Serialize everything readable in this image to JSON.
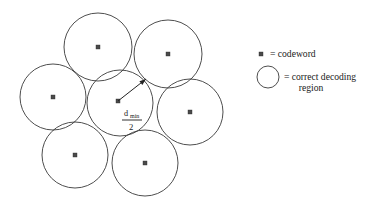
{
  "figure": {
    "name": "sphere-packing-decoding-regions",
    "background_color": "#ffffff",
    "stroke_color": "#3a3a3a",
    "marker_color": "#4a4a4a",
    "text_color": "#1a1a1a"
  },
  "circles": [
    {
      "id": "circle-top-left",
      "cx": 98,
      "cy": 47,
      "r": 34
    },
    {
      "id": "circle-top-right",
      "cx": 168,
      "cy": 54,
      "r": 34
    },
    {
      "id": "circle-middle-left",
      "cx": 53,
      "cy": 97,
      "r": 33
    },
    {
      "id": "circle-center",
      "cx": 120,
      "cy": 103,
      "r": 33
    },
    {
      "id": "circle-middle-right",
      "cx": 190,
      "cy": 112,
      "r": 33
    },
    {
      "id": "circle-bottom-left",
      "cx": 75,
      "cy": 155,
      "r": 33
    },
    {
      "id": "circle-bottom-right",
      "cx": 145,
      "cy": 163,
      "r": 33
    }
  ],
  "codewords": [
    {
      "id": "codeword-top-left",
      "x": 98,
      "y": 47,
      "size": 4
    },
    {
      "id": "codeword-top-right",
      "x": 168,
      "y": 54,
      "size": 4
    },
    {
      "id": "codeword-middle-left",
      "x": 53,
      "y": 97,
      "size": 4
    },
    {
      "id": "codeword-center",
      "x": 118,
      "y": 101,
      "size": 4
    },
    {
      "id": "codeword-middle-right",
      "x": 190,
      "y": 112,
      "size": 4
    },
    {
      "id": "codeword-bottom-left",
      "x": 75,
      "y": 155,
      "size": 4
    },
    {
      "id": "codeword-bottom-right",
      "x": 145,
      "y": 163,
      "size": 4
    }
  ],
  "radius_annotation": {
    "label_numerator": "d",
    "label_subscript": "min",
    "label_denominator": "2",
    "arrow_start_x": 118,
    "arrow_start_y": 101,
    "arrow_end_x": 146,
    "arrow_end_y": 79,
    "numerator_x": 124,
    "numerator_y": 116,
    "subscript_x": 130,
    "subscript_y": 118,
    "bar_x1": 122,
    "bar_x2": 142,
    "bar_y": 120,
    "denominator_x": 129,
    "denominator_y": 130
  },
  "legend": {
    "entries": [
      {
        "id": "legend-codeword",
        "symbol": "square-marker",
        "symbol_x": 261,
        "symbol_y": 54,
        "symbol_size": 4,
        "text": "= codeword",
        "text_x": 270,
        "text_y": 57
      },
      {
        "id": "legend-decoding-region",
        "symbol": "circle-outline",
        "symbol_cx": 268,
        "symbol_cy": 77,
        "symbol_r": 11,
        "text_line1": "= correct decoding",
        "text_line2": "region",
        "text_x": 284,
        "text_y": 80,
        "text_line2_x": 311,
        "text_line2_y": 91
      }
    ]
  }
}
